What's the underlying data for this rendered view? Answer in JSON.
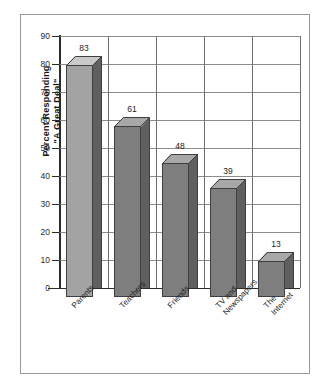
{
  "chart_data": {
    "type": "bar",
    "title": "",
    "subtitle": "",
    "xlabel": "",
    "ylabel": "Percent Responding\n\"A Great Deal\"",
    "ylabel_line1": "Percent Responding",
    "ylabel_line2": "\"A Great Deal\"",
    "categories": [
      "Parents",
      "Teachers",
      "Friends",
      "TV and\nNewspapers",
      "The\nInternet"
    ],
    "values": [
      83,
      61,
      48,
      39,
      13
    ],
    "value_labels": [
      "83",
      "61",
      "48",
      "39",
      "13"
    ],
    "ylim": [
      0,
      90
    ],
    "ytick_step": 10,
    "yticks": [
      "90",
      "80",
      "70",
      "60",
      "50",
      "40",
      "30",
      "20",
      "10",
      "0"
    ],
    "grid": "horizontal-and-vertical",
    "legend": "none",
    "style": "3d-column",
    "colors": {
      "bar_front_light": "#a3a3a3",
      "bar_front_dark": "#7e7e7e",
      "bar_top_light": "#c9c9c9",
      "bar_top_dark": "#a8a8a8",
      "bar_side": "#5f5f5f",
      "outline": "#3f3f3f",
      "grid": "#8d8d8d",
      "axis": "#2b2b2b",
      "background": "#ffffff",
      "frame": "#9a9a9a",
      "text": "#1d1d1d"
    },
    "bar_shades": [
      "light",
      "dark",
      "dark",
      "dark",
      "dark"
    ]
  }
}
